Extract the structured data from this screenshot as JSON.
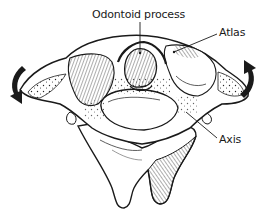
{
  "figure": {
    "labels": {
      "odontoid": "Odontoid process",
      "atlas": "Atlas",
      "axis": "Axis"
    },
    "arrows": [
      {
        "side": "left",
        "direction": "downward-curved",
        "meaning": "rotation"
      },
      {
        "side": "right",
        "direction": "upward-curved",
        "meaning": "rotation"
      }
    ],
    "colors": {
      "ink": "#1a1a1a",
      "background": "#ffffff"
    }
  }
}
